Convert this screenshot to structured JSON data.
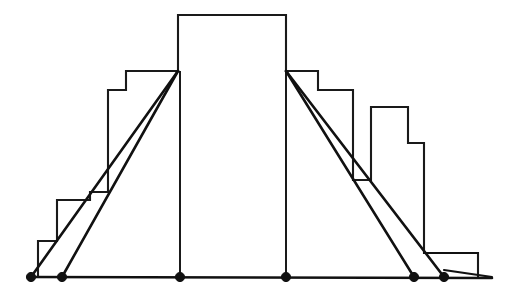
{
  "figure": {
    "background_color": "#ffffff",
    "stroke_color": "#111111",
    "width": 513,
    "height": 299
  },
  "chart_data": {
    "type": "bar",
    "title": "",
    "subtitle": "",
    "xlabel": "",
    "ylabel": "",
    "grid": false,
    "legend": null,
    "axis": {
      "baseline_y": 277,
      "baseline_x_start": 28,
      "baseline_x_end": 492,
      "xlim": [
        28,
        492
      ],
      "ylim_pixels": [
        277,
        15
      ],
      "ticks_visible": false,
      "tick_labels": []
    },
    "note": "Bar heights given as pixel top-edge y values on an inverted axis; bar value = baseline_y - top_y.",
    "bins": [
      {
        "index": 0,
        "x_left": 38,
        "x_right": 57,
        "top_y": 241,
        "value": 36
      },
      {
        "index": 1,
        "x_left": 57,
        "x_right": 90,
        "top_y": 200,
        "value": 77
      },
      {
        "index": 2,
        "x_left": 90,
        "x_right": 108,
        "top_y": 192,
        "value": 85
      },
      {
        "index": 3,
        "x_left": 108,
        "x_right": 126,
        "top_y": 90,
        "value": 187
      },
      {
        "index": 4,
        "x_left": 126,
        "x_right": 178,
        "top_y": 71,
        "value": 206
      },
      {
        "index": 5,
        "x_left": 178,
        "x_right": 286,
        "top_y": 15,
        "value": 262
      },
      {
        "index": 6,
        "x_left": 286,
        "x_right": 318,
        "top_y": 71,
        "value": 206
      },
      {
        "index": 7,
        "x_left": 318,
        "x_right": 353,
        "top_y": 90,
        "value": 187
      },
      {
        "index": 8,
        "x_left": 353,
        "x_right": 371,
        "top_y": 180,
        "value": 97
      },
      {
        "index": 9,
        "x_left": 371,
        "x_right": 408,
        "top_y": 107,
        "value": 170
      },
      {
        "index": 10,
        "x_left": 408,
        "x_right": 424,
        "top_y": 143,
        "value": 134
      },
      {
        "index": 11,
        "x_left": 424,
        "x_right": 478,
        "top_y": 253,
        "value": 24
      }
    ],
    "categories": [
      "b0",
      "b1",
      "b2",
      "b3",
      "b4",
      "b5",
      "b6",
      "b7",
      "b8",
      "b9",
      "b10",
      "b11"
    ],
    "values": [
      36,
      77,
      85,
      187,
      206,
      262,
      206,
      187,
      97,
      170,
      134,
      24
    ],
    "tangent_lines": [
      {
        "name": "left-outer-tangent",
        "x1": 31,
        "y1": 277,
        "x2": 178,
        "y2": 71
      },
      {
        "name": "left-inner-tangent",
        "x1": 62,
        "y1": 277,
        "x2": 178,
        "y2": 71
      },
      {
        "name": "right-inner-tangent",
        "x1": 286,
        "y1": 71,
        "x2": 414,
        "y2": 277
      },
      {
        "name": "right-outer-tangent",
        "x1": 286,
        "y1": 71,
        "x2": 444,
        "y2": 277
      }
    ],
    "stems": [
      {
        "name": "center-left-stem",
        "x": 180,
        "y_top": 71,
        "y_bottom": 277
      },
      {
        "name": "center-right-stem",
        "x": 286,
        "y_top": 71,
        "y_bottom": 277
      }
    ],
    "knots": [
      {
        "index": 0,
        "x": 31,
        "y": 277,
        "label": ""
      },
      {
        "index": 1,
        "x": 62,
        "y": 277,
        "label": ""
      },
      {
        "index": 2,
        "x": 180,
        "y": 277,
        "label": ""
      },
      {
        "index": 3,
        "x": 286,
        "y": 277,
        "label": ""
      },
      {
        "index": 4,
        "x": 414,
        "y": 277,
        "label": ""
      },
      {
        "index": 5,
        "x": 444,
        "y": 277,
        "label": ""
      }
    ],
    "tail_segments": [
      {
        "name": "right-upper-tail",
        "x1": 424,
        "y1": 253,
        "x2": 478,
        "y2": 253
      },
      {
        "name": "right-lower-tail",
        "x1": 444,
        "y1": 270,
        "x2": 492,
        "y2": 277
      }
    ]
  }
}
